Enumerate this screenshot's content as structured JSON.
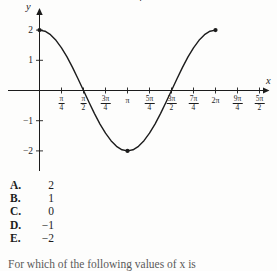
{
  "top_fragment": {
    "text": "4"
  },
  "graph": {
    "xlabel": "x",
    "ylabel": "y",
    "y_ticks": [
      {
        "v": 2,
        "label": "2"
      },
      {
        "v": 1,
        "label": "1"
      },
      {
        "v": -1,
        "label": "−1"
      },
      {
        "v": -2,
        "label": "−2"
      }
    ],
    "x_ticks": [
      {
        "v": 0.25,
        "num": "π",
        "den": "4"
      },
      {
        "v": 0.5,
        "num": "π",
        "den": "2"
      },
      {
        "v": 0.75,
        "num": "3π",
        "den": "4"
      },
      {
        "v": 1,
        "text": "π"
      },
      {
        "v": 1.25,
        "num": "5π",
        "den": "4"
      },
      {
        "v": 1.5,
        "num": "3π",
        "den": "2"
      },
      {
        "v": 1.75,
        "num": "7π",
        "den": "4"
      },
      {
        "v": 2,
        "text": "2π"
      },
      {
        "v": 2.25,
        "num": "9π",
        "den": "4"
      },
      {
        "v": 2.5,
        "num": "5π",
        "den": "2"
      }
    ]
  },
  "chart_data": {
    "type": "line",
    "title": "",
    "xlabel": "x",
    "ylabel": "y",
    "x_axis_units": "multiples of π",
    "xlim_pi": [
      0,
      2.7
    ],
    "ylim": [
      -2.6,
      2.6
    ],
    "grid": false,
    "x_tick_labels": [
      "π/4",
      "π/2",
      "3π/4",
      "π",
      "5π/4",
      "3π/2",
      "7π/4",
      "2π",
      "9π/4",
      "5π/2"
    ],
    "y_tick_labels": [
      "2",
      "1",
      "−1",
      "−2"
    ],
    "series_note": "curve of amplitude-2 cosine wave over one period, 0 to 2π",
    "x_pi": [
      0,
      0.0625,
      0.125,
      0.1875,
      0.25,
      0.3125,
      0.375,
      0.4375,
      0.5,
      0.5625,
      0.625,
      0.6875,
      0.75,
      0.8125,
      0.875,
      0.9375,
      1,
      1.0625,
      1.125,
      1.1875,
      1.25,
      1.3125,
      1.375,
      1.4375,
      1.5,
      1.5625,
      1.625,
      1.6875,
      1.75,
      1.8125,
      1.875,
      1.9375,
      2
    ],
    "y": [
      2,
      1.962,
      1.848,
      1.663,
      1.414,
      1.111,
      0.765,
      0.39,
      0,
      -0.39,
      -0.765,
      -1.111,
      -1.414,
      -1.663,
      -1.848,
      -1.962,
      -2,
      -1.962,
      -1.848,
      -1.663,
      -1.414,
      -1.111,
      -0.765,
      -0.39,
      0,
      0.39,
      0.765,
      1.111,
      1.414,
      1.663,
      1.848,
      1.962,
      2
    ],
    "marked_points": [
      {
        "x_pi": 0,
        "y": 2
      },
      {
        "x_pi": 1,
        "y": -2
      },
      {
        "x_pi": 2,
        "y": 2
      }
    ],
    "ink_color": "#1c1c1c"
  },
  "answers": {
    "choices": [
      {
        "letter": "A.",
        "value": "2"
      },
      {
        "letter": "B.",
        "value": "1"
      },
      {
        "letter": "C.",
        "value": "0"
      },
      {
        "letter": "D.",
        "value": "−1"
      },
      {
        "letter": "E.",
        "value": "−2"
      }
    ]
  },
  "question": {
    "text": "For which of the following values of x is"
  }
}
